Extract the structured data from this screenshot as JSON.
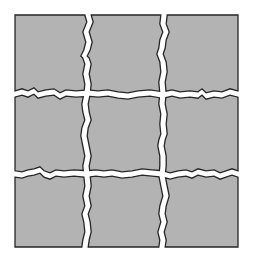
{
  "diagram": {
    "title": "Square fractured into a 3 by 3 grid of pieces",
    "rows": 3,
    "columns": 3,
    "piece_count": 9,
    "colors": {
      "background": "#ffffff",
      "piece_fill": "#b3b3b3",
      "piece_outline": "#262626",
      "crack": "#ffffff"
    },
    "pieces": [
      {
        "id": "piece-r1-c1",
        "row": 1,
        "column": 1
      },
      {
        "id": "piece-r1-c2",
        "row": 1,
        "column": 2
      },
      {
        "id": "piece-r1-c3",
        "row": 1,
        "column": 3
      },
      {
        "id": "piece-r2-c1",
        "row": 2,
        "column": 1
      },
      {
        "id": "piece-r2-c2",
        "row": 2,
        "column": 2
      },
      {
        "id": "piece-r2-c3",
        "row": 2,
        "column": 3
      },
      {
        "id": "piece-r3-c1",
        "row": 3,
        "column": 1
      },
      {
        "id": "piece-r3-c2",
        "row": 3,
        "column": 2
      },
      {
        "id": "piece-r3-c3",
        "row": 3,
        "column": 3
      }
    ]
  }
}
